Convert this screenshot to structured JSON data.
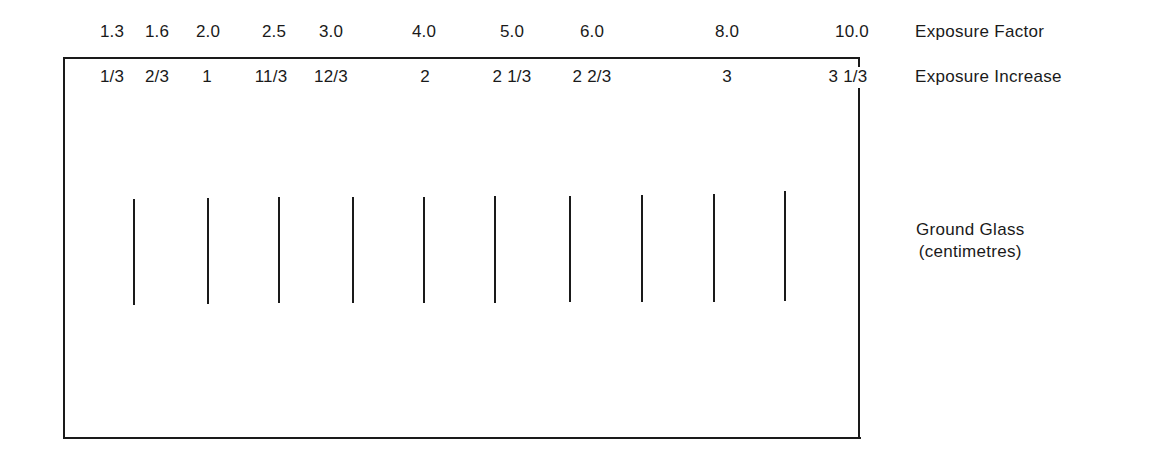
{
  "diagram": {
    "exposure_factor": {
      "title": "Exposure Factor",
      "values": [
        "1.3",
        "1.6",
        "2.0",
        "2.5",
        "3.0",
        "4.0",
        "5.0",
        "6.0",
        "8.0",
        "10.0"
      ]
    },
    "exposure_increase": {
      "title": "Exposure Increase",
      "values": [
        "1/3",
        "2/3",
        "1",
        "11/3",
        "12/3",
        "2",
        "2 1/3",
        "2 2/3",
        "3",
        "3 1/3"
      ]
    },
    "ground_glass": {
      "title_line1": "Ground Glass",
      "title_line2": "(centimetres)",
      "tick_count": 10
    },
    "colors": {
      "ink": "#1a1a1a",
      "background": "#ffffff"
    }
  }
}
